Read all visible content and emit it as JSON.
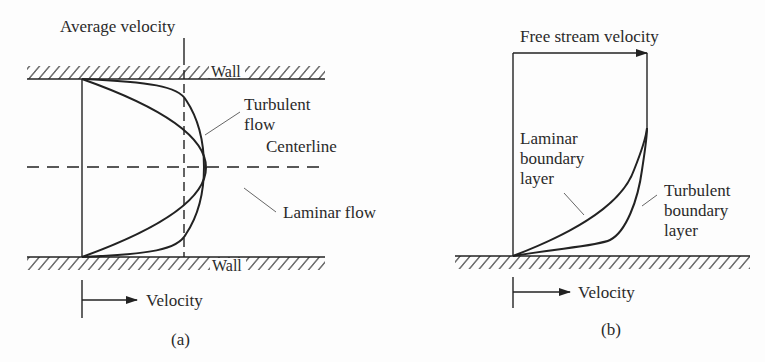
{
  "figure_a": {
    "caption": "(a)",
    "labels": {
      "average_velocity": "Average velocity",
      "wall_top": "Wall",
      "wall_bottom": "Wall",
      "turbulent_line1": "Turbulent",
      "turbulent_line2": "flow",
      "centerline": "Centerline",
      "laminar": "Laminar flow",
      "velocity_axis": "Velocity"
    }
  },
  "figure_b": {
    "caption": "(b)",
    "labels": {
      "free_stream": "Free stream velocity",
      "laminar_line1": "Laminar",
      "laminar_line2": "boundary",
      "laminar_line3": "layer",
      "turbulent_line1": "Turbulent",
      "turbulent_line2": "boundary",
      "turbulent_line3": "layer",
      "velocity_axis": "Velocity"
    }
  },
  "colors": {
    "ink": "#222222",
    "background": "#fdfdfd"
  }
}
